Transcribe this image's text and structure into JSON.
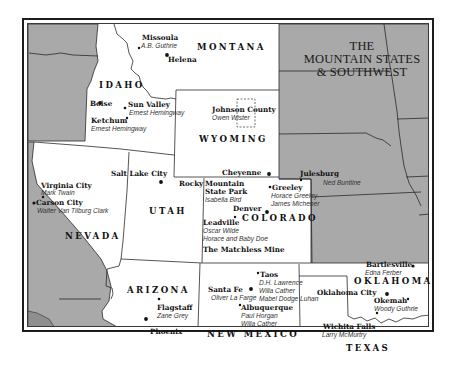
{
  "title": {
    "line1": "THE",
    "line2": "MOUNTAIN STATES",
    "line3": "& SOUTHWEST"
  },
  "colors": {
    "featured_state_fill": "#ffffff",
    "other_state_fill": "#a9a9a9",
    "darker_region_fill": "#8f8f8f",
    "border": "#1c1c1c",
    "text": "#111111"
  },
  "states": {
    "montana": "MONTANA",
    "idaho": "IDAHO",
    "wyoming": "WYOMING",
    "utah": "UTAH",
    "nevada": "NEVADA",
    "colorado": "COLORADO",
    "arizona": "ARIZONA",
    "new_mexico": "NEW MEXICO",
    "oklahoma": "OKLAHOMA",
    "texas": "TEXAS"
  },
  "places": {
    "missoula": {
      "city": "Missoula",
      "authors": [
        "A.B. Guthrie"
      ]
    },
    "helena": {
      "city": "Helena"
    },
    "boise": {
      "city": "Boise"
    },
    "sun_valley": {
      "city": "Sun Valley",
      "authors": [
        "Ernest Hemingway"
      ]
    },
    "ketchum": {
      "city": "Ketchum",
      "authors": [
        "Ernest Hemingway"
      ]
    },
    "johnson_county": {
      "city": "Johnson County",
      "authors": [
        "Owen Wister"
      ]
    },
    "cheyenne": {
      "city": "Cheyenne"
    },
    "julesburg": {
      "city": "Julesburg",
      "authors": [
        "Ned Buntline"
      ]
    },
    "salt_lake_city": {
      "city": "Salt Lake City"
    },
    "virginia_city": {
      "city": "Virginia City",
      "authors": [
        "Mark Twain"
      ]
    },
    "carson_city": {
      "city": "Carson City",
      "authors": [
        "Walter Van Tilburg Clark"
      ]
    },
    "rocky_mountain": {
      "city_part1": "Rocky",
      "city_part2": "Mountain",
      "city_part3": "State Park",
      "authors": [
        "Isabella Bird"
      ]
    },
    "greeley": {
      "city": "Greeley",
      "authors": [
        "Horace Greeley",
        "James Michener"
      ]
    },
    "denver": {
      "city": "Denver"
    },
    "leadville": {
      "city": "Leadville",
      "authors": [
        "Oscar Wilde",
        "Horace and Baby Doe"
      ]
    },
    "matchless_mine": {
      "city": "The Matchless Mine"
    },
    "flagstaff": {
      "city": "Flagstaff",
      "authors": [
        "Zane Grey"
      ]
    },
    "phoenix": {
      "city": "Phoenix"
    },
    "taos": {
      "city": "Taos",
      "authors": [
        "D.H. Lawrence",
        "Willa Cather",
        "Mabel Dodge Luhan"
      ]
    },
    "santa_fe": {
      "city": "Santa Fe",
      "authors": [
        "Oliver La Farge"
      ]
    },
    "albuquerque": {
      "city": "Albuquerque",
      "authors": [
        "Paul Horgan",
        "Willa Cather"
      ]
    },
    "bartlesville": {
      "city": "Bartlesville",
      "authors": [
        "Edna Ferber"
      ]
    },
    "oklahoma_city": {
      "city": "Oklahoma City"
    },
    "okemah": {
      "city": "Okemah",
      "authors": [
        "Woody Guthrie"
      ]
    },
    "wichita_falls": {
      "city": "Wichita Falls",
      "authors": [
        "Larry McMurtry"
      ]
    }
  }
}
